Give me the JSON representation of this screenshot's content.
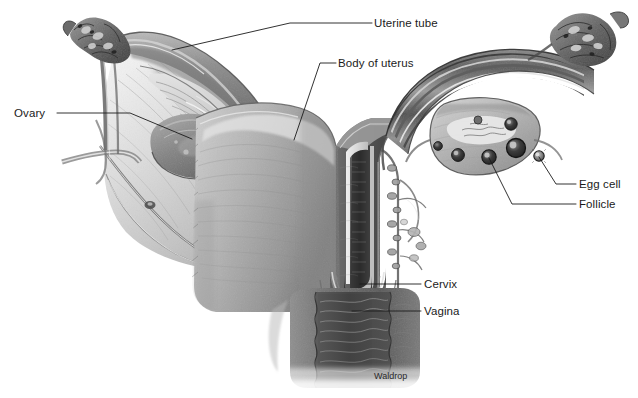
{
  "figure": {
    "kind": "anatomical-illustration",
    "background_color": "#ffffff",
    "ink_color": "#1b1b1b",
    "width": 638,
    "height": 398
  },
  "labels": {
    "uterine_tube": "Uterine tube",
    "body_of_uterus": "Body of uterus",
    "ovary": "Ovary",
    "egg_cell": "Egg cell",
    "follicle": "Follicle",
    "cervix": "Cervix",
    "vagina": "Vagina"
  },
  "credit": {
    "artist": "Waldrop"
  },
  "leader_lines": [
    {
      "name": "uterine-tube-leader",
      "points": "372,23 290,23 172,50"
    },
    {
      "name": "body-of-uterus-leader",
      "points": "336,63 320,63 294,140"
    },
    {
      "name": "ovary-leader",
      "points": "57,113 130,113 192,139"
    },
    {
      "name": "egg-cell-leader",
      "points": "576,184 556,184 539,157"
    },
    {
      "name": "follicle-leader",
      "points": "576,204 512,204 489,158"
    },
    {
      "name": "cervix-leader",
      "points": "421,284 360,284"
    },
    {
      "name": "vagina-leader",
      "points": "421,311 352,311"
    }
  ],
  "structures": [
    "left fimbriae",
    "left uterine tube",
    "left ovary",
    "broad ligament",
    "uterine cavity (sectioned)",
    "myometrium",
    "endometrium",
    "cervix",
    "vaginal canal with rugae",
    "right uterine tube",
    "right ovary with follicles",
    "released egg cell",
    "right fimbriae"
  ]
}
